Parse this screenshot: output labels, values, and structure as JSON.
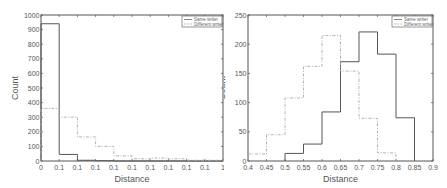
{
  "chart_data": [
    {
      "type": "bar",
      "subtype": "step-histogram",
      "title": "",
      "xlabel": "Distance",
      "ylabel": "Count",
      "xlim": [
        0,
        1
      ],
      "ylim": [
        0,
        1000
      ],
      "x_tick_labels": [
        "0",
        "0.1",
        "0.1",
        "0.1",
        "0.1",
        "0.1",
        "0.1",
        "0.1",
        "0.1",
        "0.1",
        "1"
      ],
      "y_tick_labels": [
        "0",
        "100",
        "200",
        "300",
        "400",
        "500",
        "600",
        "700",
        "800",
        "900",
        "1000"
      ],
      "bin_edges": [
        0,
        0.1,
        0.2,
        0.3,
        0.4,
        0.5,
        0.6,
        0.7,
        0.8,
        0.9,
        1.0
      ],
      "grid": false,
      "legend_position": "upper right",
      "series": [
        {
          "name": "Same writer",
          "style": "solid",
          "values": [
            940,
            45,
            5,
            2,
            0,
            0,
            0,
            0,
            0,
            0
          ]
        },
        {
          "name": "Different writer",
          "style": "dashed",
          "values": [
            360,
            300,
            165,
            100,
            35,
            15,
            20,
            15,
            5,
            5
          ]
        }
      ]
    },
    {
      "type": "bar",
      "subtype": "step-histogram",
      "title": "",
      "xlabel": "Distance",
      "ylabel": "Count",
      "xlim": [
        0.4,
        0.9
      ],
      "ylim": [
        0,
        250
      ],
      "x_tick_labels": [
        "0.4",
        "0.45",
        "0.5",
        "0.55",
        "0.6",
        "0.65",
        "0.7",
        "0.75",
        "0.8",
        "0.85",
        "0.9"
      ],
      "y_tick_labels": [
        "0",
        "50",
        "100",
        "150",
        "200",
        "250"
      ],
      "bin_edges": [
        0.4,
        0.45,
        0.5,
        0.55,
        0.6,
        0.65,
        0.7,
        0.75,
        0.8,
        0.85
      ],
      "grid": false,
      "legend_position": "upper right",
      "series": [
        {
          "name": "Same writer",
          "style": "solid",
          "values": [
            0,
            0,
            13,
            29,
            84,
            170,
            221,
            183,
            74
          ]
        },
        {
          "name": "Different writer",
          "style": "dashed",
          "values": [
            12,
            45,
            108,
            162,
            215,
            154,
            73,
            14,
            0
          ]
        }
      ]
    }
  ],
  "colors": {
    "axis": "#555555",
    "same_writer": "#555555",
    "different_writer": "#aaaaaa"
  }
}
